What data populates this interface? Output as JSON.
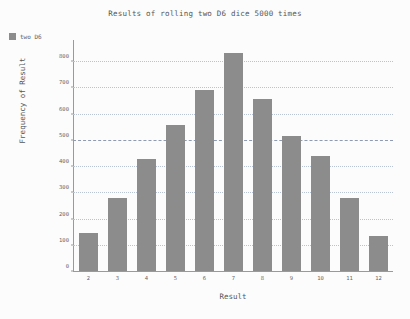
{
  "figure": {
    "background_color": "#fcfcfc",
    "bar_color": "#8c8c8c",
    "grid_color": "#b9c3d6",
    "axis_color": "#9a9a9a"
  },
  "legend": {
    "entries": [
      {
        "label": "two D6",
        "color": "#8c8c8c"
      }
    ]
  },
  "chart_data": {
    "type": "bar",
    "title": "Results of rolling two D6 dice 5000 times",
    "xlabel": "Result",
    "ylabel": "Frequency of Result",
    "categories": [
      "2",
      "3",
      "4",
      "5",
      "6",
      "7",
      "8",
      "9",
      "10",
      "11",
      "12"
    ],
    "values": [
      145,
      280,
      425,
      555,
      690,
      830,
      655,
      515,
      440,
      280,
      135
    ],
    "series": [
      {
        "name": "two D6",
        "values": [
          145,
          280,
          425,
          555,
          690,
          830,
          655,
          515,
          440,
          280,
          135
        ]
      }
    ],
    "ylim": [
      0,
      880
    ],
    "yticks": [
      0,
      100,
      200,
      300,
      400,
      500,
      600,
      700,
      800
    ],
    "ytick_labels": [
      "0",
      "100",
      "200",
      "300",
      "400",
      "500",
      "600",
      "700",
      "800"
    ],
    "emphasized_gridline": 500,
    "grid": true,
    "legend_position": "upper left outside"
  }
}
